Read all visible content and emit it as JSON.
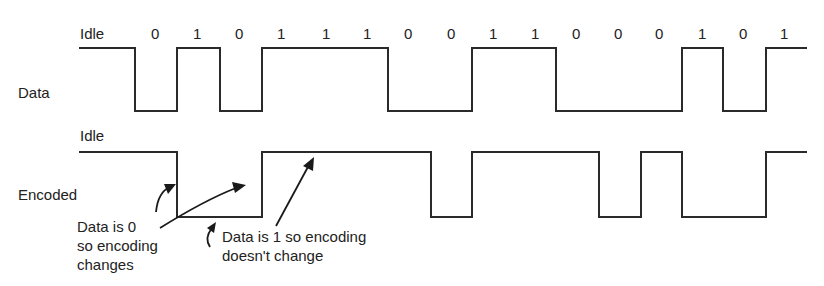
{
  "diagram": {
    "data_row": {
      "label": "Data",
      "idle_label": "Idle",
      "bits": [
        "0",
        "1",
        "0",
        "1",
        "1",
        "1",
        "0",
        "0",
        "1",
        "1",
        "0",
        "0",
        "0",
        "1",
        "0",
        "1"
      ]
    },
    "encoded_row": {
      "label": "Encoded",
      "idle_label": "Idle"
    },
    "annotations": {
      "zero_note": [
        "Data is 0",
        "so encoding",
        "changes"
      ],
      "one_note": [
        "Data is 1 so encoding",
        "doesn't change"
      ]
    }
  }
}
